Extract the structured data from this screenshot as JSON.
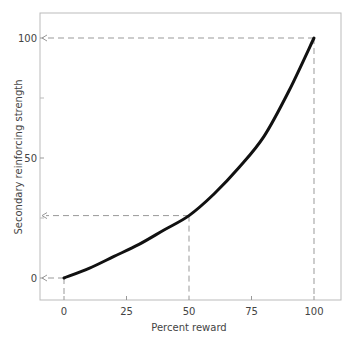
{
  "chart_data": {
    "type": "line",
    "title": "",
    "xlabel": "Percent reward",
    "ylabel": "Secondary reinforcing strength",
    "xlim": [
      -9,
      110
    ],
    "ylim": [
      -9,
      112
    ],
    "x_ticks": [
      0,
      25,
      50,
      75,
      100
    ],
    "x_tick_labels": [
      "0",
      "25",
      "50",
      "75",
      "100"
    ],
    "y_ticks": [
      0,
      50,
      100
    ],
    "y_tick_labels": [
      "0",
      "50",
      "100"
    ],
    "y_minor_ticks": [
      25,
      75
    ],
    "grid": false,
    "legend": null,
    "series": [
      {
        "name": "Secondary reinforcing strength",
        "x": [
          0,
          10,
          20,
          30,
          40,
          50,
          60,
          70,
          80,
          90,
          100
        ],
        "values": [
          0,
          4,
          9,
          14,
          20,
          26,
          35,
          46,
          59,
          78,
          100
        ]
      }
    ],
    "annotations": [
      {
        "type": "dashed-arrow",
        "from": [
          0,
          0
        ],
        "to": "y-axis",
        "label": "0"
      },
      {
        "type": "dashed-arrow",
        "from": [
          50,
          26
        ],
        "to": "y-axis"
      },
      {
        "type": "dashed-arrow",
        "from": [
          100,
          100
        ],
        "to": "y-axis",
        "label": "100"
      },
      {
        "type": "dashed-drop",
        "x": 0
      },
      {
        "type": "dashed-drop",
        "x": 50
      },
      {
        "type": "dashed-drop",
        "x": 100
      }
    ]
  }
}
